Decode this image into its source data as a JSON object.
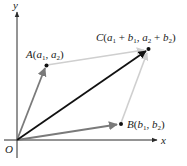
{
  "diagram": {
    "colors": {
      "axis": "#2a2a2a",
      "vector_a": "#7a7a7a",
      "vector_b": "#7a7a7a",
      "resultant": "#111111",
      "guide": "#cfcfcf",
      "point": "#111111"
    },
    "axes": {
      "x_label": "x",
      "y_label": "y",
      "origin_label": "O"
    },
    "points": {
      "A": {
        "name": "A",
        "open": "(",
        "c1": "a",
        "c1_sub": "1",
        "sep": ", ",
        "c2": "a",
        "c2_sub": "2",
        "close": ")"
      },
      "B": {
        "name": "B",
        "open": "(",
        "c1": "b",
        "c1_sub": "1",
        "sep": ", ",
        "c2": "b",
        "c2_sub": "2",
        "close": ")"
      },
      "C": {
        "name": "C",
        "open": "(",
        "t1": "a",
        "t1_sub": "1",
        "plus1": " + ",
        "t2": "b",
        "t2_sub": "1",
        "sep": ", ",
        "t3": "a",
        "t3_sub": "2",
        "plus2": " + ",
        "t4": "b",
        "t4_sub": "2",
        "close": ")"
      }
    },
    "vectors": [
      {
        "from": "O",
        "to": "A",
        "style": "gray arrow"
      },
      {
        "from": "O",
        "to": "B",
        "style": "gray arrow"
      },
      {
        "from": "O",
        "to": "C",
        "style": "black arrow (resultant)"
      },
      {
        "from": "A",
        "to": "C",
        "style": "light guide arrow"
      },
      {
        "from": "B",
        "to": "C",
        "style": "light guide arrow"
      }
    ]
  }
}
